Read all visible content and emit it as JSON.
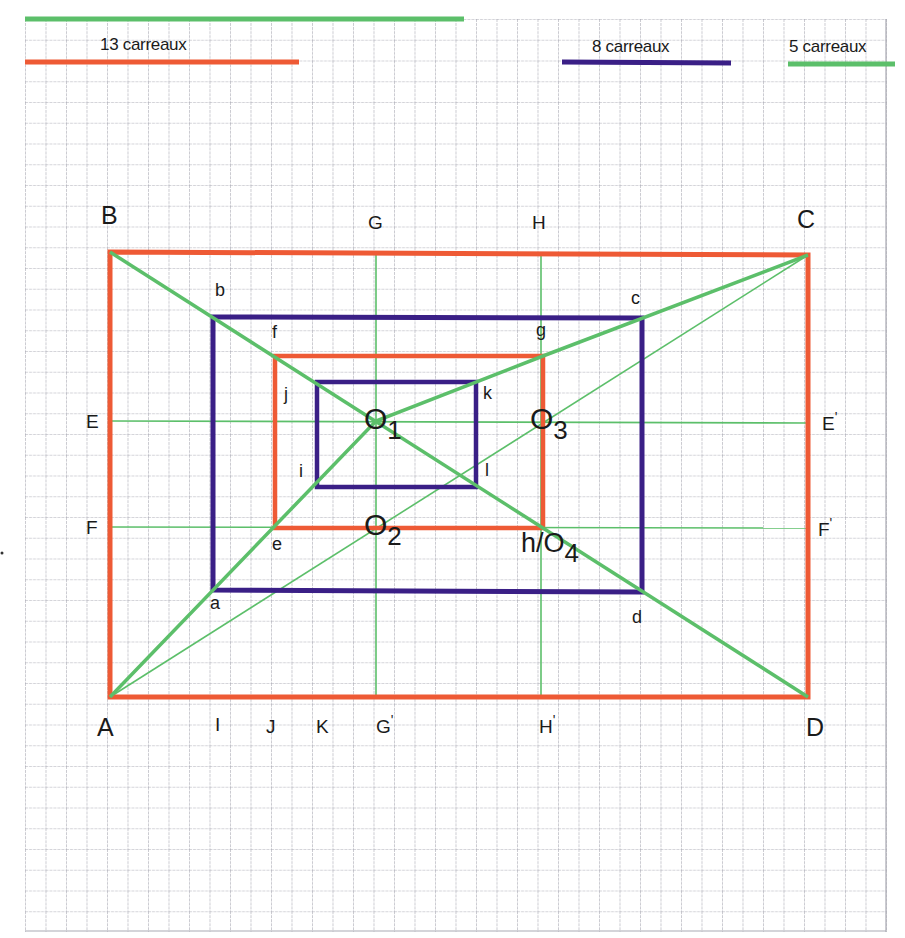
{
  "legend": {
    "top_partial_label": "21 carreaux",
    "red": {
      "label": "13 carreaux",
      "cells": 13
    },
    "blue": {
      "label": "8 carreaux",
      "cells": 8
    },
    "green": {
      "label": "5 carreaux",
      "cells": 5
    }
  },
  "colors": {
    "grid": "#a9a9b3",
    "red": "#ee5a35",
    "blue": "#3a1f86",
    "green": "#5cbf6a",
    "text": "#1a1a1a"
  },
  "points": {
    "A": "A",
    "B": "B",
    "C": "C",
    "D": "D",
    "a": "a",
    "b": "b",
    "c": "c",
    "d": "d",
    "e": "e",
    "f": "f",
    "g": "g",
    "i": "i",
    "j": "j",
    "k": "k",
    "l": "l",
    "E": "E",
    "F": "F",
    "G": "G",
    "H": "H",
    "E_prime": "E",
    "F_prime": "F",
    "G_prime": "G",
    "H_prime": "H",
    "I": "I",
    "J": "J",
    "K": "K",
    "h_O4": "h/O",
    "O": "O",
    "sub1": "1",
    "sub2": "2",
    "sub3": "3",
    "sub4": "4",
    "prime_mark": "'"
  }
}
